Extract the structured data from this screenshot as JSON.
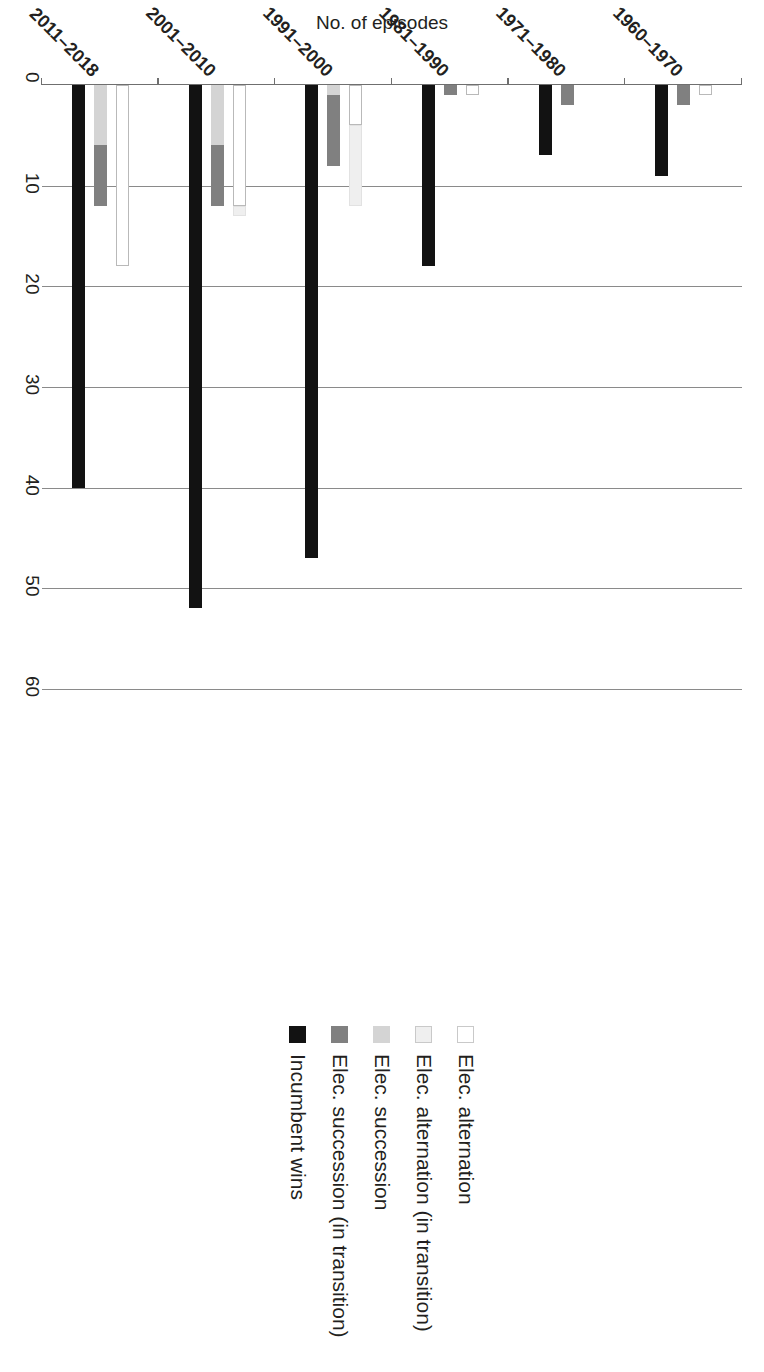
{
  "chart_data": {
    "type": "bar",
    "orientation": "horizontal-grouped-stacked",
    "title": "",
    "xlabel": "",
    "ylabel": "No. of episodes",
    "ylim": [
      0,
      60
    ],
    "yticks": [
      0,
      10,
      20,
      30,
      40,
      50,
      60
    ],
    "grid": true,
    "legend_position": "right",
    "categories": [
      "1960–1970",
      "1971–1980",
      "1981–1990",
      "1991–2000",
      "2001–2010",
      "2011–2018"
    ],
    "series": [
      {
        "name": "Elec. alternation",
        "color": "#ffffff",
        "values": [
          1,
          0,
          1,
          4,
          12,
          18
        ]
      },
      {
        "name": "Elec. alternation (in transition)",
        "color": "#efefef",
        "values": [
          0,
          0,
          0,
          8,
          0,
          0
        ]
      },
      {
        "name": "Elec. succession",
        "color": "#d4d4d4",
        "values": [
          0,
          0,
          0,
          1,
          6,
          6
        ]
      },
      {
        "name": "Elec. succession (in transition)",
        "color": "#808080",
        "values": [
          2,
          2,
          1,
          7,
          6,
          6
        ]
      },
      {
        "name": "Incumbent wins",
        "color": "#121212",
        "values": [
          9,
          7,
          18,
          47,
          52,
          40
        ]
      }
    ],
    "bar_groups": [
      {
        "category": "1960–1970",
        "rows": [
          {
            "series": [
              "Elec. alternation",
              "Elec. alternation (in transition)"
            ],
            "values": [
              1,
              0
            ]
          },
          {
            "series": [
              "Elec. succession",
              "Elec. succession (in transition)"
            ],
            "values": [
              0,
              2
            ]
          },
          {
            "series": [
              "Incumbent wins"
            ],
            "values": [
              9
            ]
          }
        ]
      },
      {
        "category": "1971–1980",
        "rows": [
          {
            "series": [
              "Elec. alternation",
              "Elec. alternation (in transition)"
            ],
            "values": [
              0,
              0
            ]
          },
          {
            "series": [
              "Elec. succession",
              "Elec. succession (in transition)"
            ],
            "values": [
              0,
              2
            ]
          },
          {
            "series": [
              "Incumbent wins"
            ],
            "values": [
              7
            ]
          }
        ]
      },
      {
        "category": "1981–1990",
        "rows": [
          {
            "series": [
              "Elec. alternation",
              "Elec. alternation (in transition)"
            ],
            "values": [
              1,
              0
            ]
          },
          {
            "series": [
              "Elec. succession",
              "Elec. succession (in transition)"
            ],
            "values": [
              0,
              1
            ]
          },
          {
            "series": [
              "Incumbent wins"
            ],
            "values": [
              18
            ]
          }
        ]
      },
      {
        "category": "1991–2000",
        "rows": [
          {
            "series": [
              "Elec. alternation",
              "Elec. alternation (in transition)"
            ],
            "values": [
              4,
              8
            ]
          },
          {
            "series": [
              "Elec. succession",
              "Elec. succession (in transition)"
            ],
            "values": [
              1,
              7
            ]
          },
          {
            "series": [
              "Incumbent wins"
            ],
            "values": [
              47
            ]
          }
        ]
      },
      {
        "category": "2001–2010",
        "rows": [
          {
            "series": [
              "Elec. alternation",
              "Elec. alternation (in transition)"
            ],
            "values": [
              12,
              1
            ]
          },
          {
            "series": [
              "Elec. succession",
              "Elec. succession (in transition)"
            ],
            "values": [
              6,
              6
            ]
          },
          {
            "series": [
              "Incumbent wins"
            ],
            "values": [
              52
            ]
          }
        ]
      },
      {
        "category": "2011–2018",
        "rows": [
          {
            "series": [
              "Elec. alternation",
              "Elec. alternation (in transition)"
            ],
            "values": [
              18,
              0
            ]
          },
          {
            "series": [
              "Elec. succession",
              "Elec. succession (in transition)"
            ],
            "values": [
              6,
              6
            ]
          },
          {
            "series": [
              "Incumbent wins"
            ],
            "values": [
              40
            ]
          }
        ]
      }
    ]
  },
  "axis": {
    "y_title": "No. of episodes",
    "ticks": [
      "0",
      "10",
      "20",
      "30",
      "40",
      "50",
      "60"
    ],
    "categories": [
      "1960–1970",
      "1971–1980",
      "1981–1990",
      "1991–2000",
      "2001–2010",
      "2011–2018"
    ]
  },
  "legend": {
    "items": [
      {
        "label": "Elec. alternation",
        "swatch": "white-square-swatch",
        "color": "#ffffff"
      },
      {
        "label": "Elec. alternation (in transition)",
        "swatch": "very-light-gray-swatch",
        "color": "#efefef"
      },
      {
        "label": "Elec. succession",
        "swatch": "light-gray-square-swatch",
        "color": "#d4d4d4"
      },
      {
        "label": "Elec. succession (in transition)",
        "swatch": "medium-gray-square-swatch",
        "color": "#808080"
      },
      {
        "label": "Incumbent wins",
        "swatch": "black-square-swatch",
        "color": "#121212"
      }
    ]
  }
}
